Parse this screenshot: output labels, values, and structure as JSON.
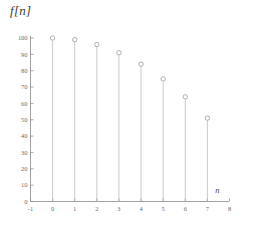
{
  "chart_data": {
    "type": "scatter",
    "subtype": "stem",
    "title": "f[n]",
    "xlabel": "n",
    "ylabel": "f[n]",
    "x": [
      0,
      1,
      2,
      3,
      4,
      5,
      6,
      7
    ],
    "values": [
      100,
      99,
      96,
      91,
      84,
      75,
      64,
      51
    ],
    "categories": [
      "0",
      "1",
      "2",
      "3",
      "4",
      "5",
      "6",
      "7"
    ],
    "xlim": [
      -1,
      8
    ],
    "ylim": [
      0,
      100
    ],
    "xticks": [
      -1,
      0,
      1,
      2,
      3,
      4,
      5,
      6,
      7,
      8
    ],
    "xtick_labels": [
      "-1",
      "0",
      "1",
      "2",
      "3",
      "4",
      "5",
      "6",
      "7",
      "8"
    ],
    "yticks": [
      0,
      10,
      20,
      30,
      40,
      50,
      60,
      70,
      80,
      90,
      100
    ],
    "ytick_labels": [
      "0",
      "10",
      "20",
      "30",
      "40",
      "50",
      "60",
      "70",
      "80",
      "90",
      "100"
    ],
    "grid": false,
    "legend": false,
    "legend_position": "none",
    "marker": "open-circle",
    "colors": {
      "axis": "#8a8a8a",
      "stem": "#b4b4b4",
      "marker_edge": "#9a9a9a",
      "marker_fill": "#ffffff",
      "tick_label": "#6a6a6a",
      "axis_label": "#4a4a4a",
      "background": "#ffffff"
    }
  },
  "axis_names": {
    "x": "n",
    "y": "f[n]"
  }
}
